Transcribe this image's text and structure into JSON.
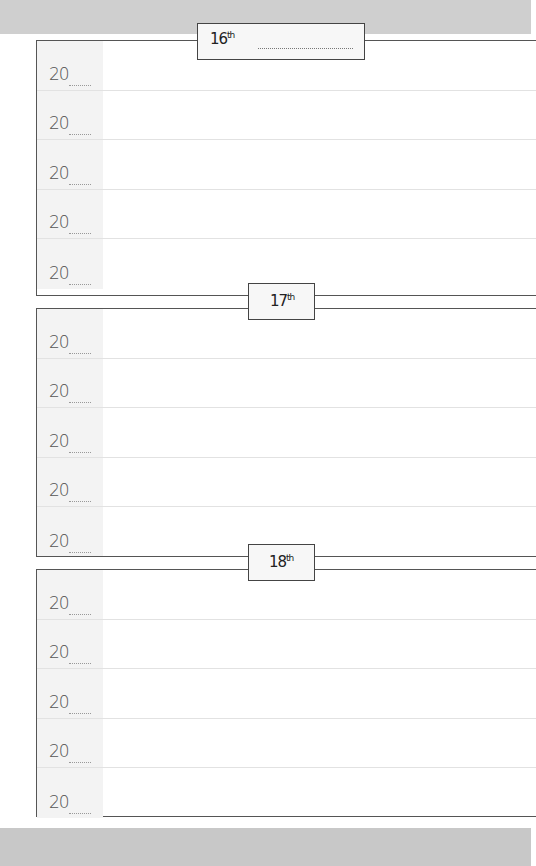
{
  "planner": {
    "days": [
      {
        "number": "16",
        "suffix": "th",
        "rows": [
          {
            "year_prefix": "20"
          },
          {
            "year_prefix": "20"
          },
          {
            "year_prefix": "20"
          },
          {
            "year_prefix": "20"
          },
          {
            "year_prefix": "20"
          }
        ]
      },
      {
        "number": "17",
        "suffix": "th",
        "rows": [
          {
            "year_prefix": "20"
          },
          {
            "year_prefix": "20"
          },
          {
            "year_prefix": "20"
          },
          {
            "year_prefix": "20"
          },
          {
            "year_prefix": "20"
          }
        ]
      },
      {
        "number": "18",
        "suffix": "th",
        "rows": [
          {
            "year_prefix": "20"
          },
          {
            "year_prefix": "20"
          },
          {
            "year_prefix": "20"
          },
          {
            "year_prefix": "20"
          },
          {
            "year_prefix": "20"
          }
        ]
      }
    ]
  },
  "colors": {
    "border": "#555555",
    "band": "#cfcfcf",
    "row_shade": "#f3f3f3"
  }
}
